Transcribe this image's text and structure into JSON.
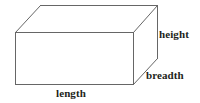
{
  "figure": {
    "name": "cuboid-dimensions-diagram",
    "type": "geometry-illustration",
    "shape": "cuboid",
    "background_color": "#ffffff",
    "line_color": "#666666",
    "label_color": "#231f20",
    "labels": {
      "height": "height",
      "breadth": "breadth",
      "length": "length"
    },
    "geometry": {
      "front_face": [
        [
          15,
          32
        ],
        [
          133,
          32
        ],
        [
          133,
          84
        ],
        [
          15,
          84
        ]
      ],
      "back_face": [
        [
          40,
          5
        ],
        [
          158,
          5
        ],
        [
          158,
          58
        ],
        [
          40,
          58
        ]
      ],
      "depth_offset": [
        25,
        -27
      ],
      "visible_vertices": [
        [
          15,
          32
        ],
        [
          133,
          32
        ],
        [
          133,
          84
        ],
        [
          15,
          84
        ],
        [
          40,
          5
        ],
        [
          158,
          5
        ],
        [
          158,
          58
        ]
      ]
    }
  }
}
